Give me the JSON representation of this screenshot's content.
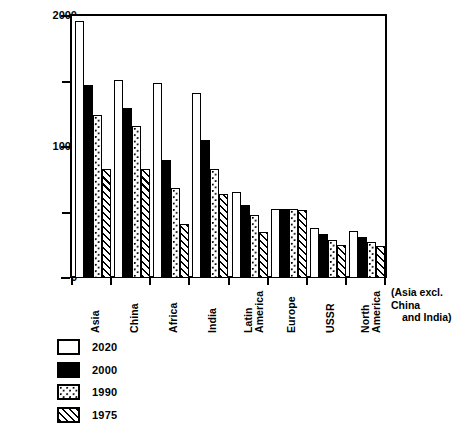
{
  "chart_data": {
    "type": "bar",
    "title": "",
    "xlabel": "",
    "ylabel": "Population (millions)",
    "ylim": [
      0,
      2000
    ],
    "y_ticks_major": [
      0,
      1000,
      2000
    ],
    "y_ticks_minor": [
      500,
      1500
    ],
    "y_tick_labels": [
      "0",
      "1000",
      "2000"
    ],
    "grid": false,
    "legend_position": "bottom-left",
    "annotation": {
      "line1": "(Asia excl. China",
      "line2": "and India)"
    },
    "categories": [
      "Asia",
      "China",
      "Africa",
      "India",
      "Latin America",
      "Europe",
      "USSR",
      "North America"
    ],
    "category_lines": [
      [
        "Asia"
      ],
      [
        "China"
      ],
      [
        "Africa"
      ],
      [
        "India"
      ],
      [
        "Latin",
        "America"
      ],
      [
        "Europe"
      ],
      [
        "USSR"
      ],
      [
        "North",
        "America"
      ]
    ],
    "series": [
      {
        "name": "2020",
        "fill": "white",
        "values": [
          1960,
          1510,
          1490,
          1410,
          660,
          530,
          385,
          360
        ]
      },
      {
        "name": "2000",
        "fill": "black",
        "values": [
          1470,
          1300,
          900,
          1050,
          555,
          530,
          335,
          315
        ]
      },
      {
        "name": "1990",
        "fill": "dotted",
        "values": [
          1245,
          1160,
          690,
          830,
          480,
          525,
          290,
          275
        ]
      },
      {
        "name": "1975",
        "fill": "hatched",
        "values": [
          830,
          830,
          410,
          640,
          350,
          520,
          255,
          245
        ]
      }
    ],
    "legend": [
      {
        "label": "2020",
        "fill": "white"
      },
      {
        "label": "2000",
        "fill": "black"
      },
      {
        "label": "1990",
        "fill": "dotted"
      },
      {
        "label": "1975",
        "fill": "hatched"
      }
    ]
  }
}
